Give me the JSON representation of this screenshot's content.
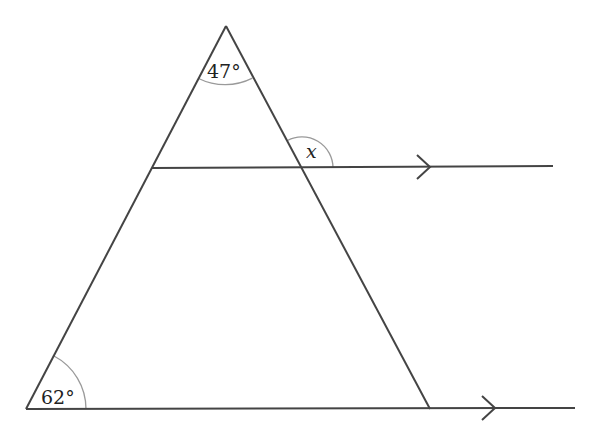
{
  "diagram": {
    "type": "geometry",
    "colors": {
      "line": "#444444",
      "arc": "#9a9a9a",
      "text": "#222222",
      "background": "#ffffff"
    },
    "vertices": {
      "apex": [
        226,
        26
      ],
      "bottom_left": [
        26,
        409
      ],
      "bottom_right": [
        430,
        409
      ]
    },
    "angles": [
      {
        "id": "apex-angle",
        "label": "47°",
        "vertex": "apex"
      },
      {
        "id": "x-angle",
        "label": "x",
        "vertex": "upper-intersection"
      },
      {
        "id": "base-angle",
        "label": "62°",
        "vertex": "bottom_left"
      }
    ],
    "parallel_lines": [
      {
        "id": "upper-line",
        "from": [
          152,
          168
        ],
        "to": [
          553,
          166
        ],
        "arrow_at": [
          430,
          167
        ]
      },
      {
        "id": "base-line",
        "from": [
          26,
          409
        ],
        "to": [
          575,
          408
        ],
        "arrow_at": [
          495,
          408
        ]
      }
    ]
  }
}
